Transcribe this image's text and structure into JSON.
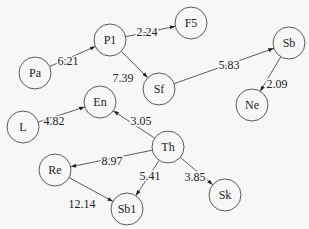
{
  "diagram": {
    "type": "directed-weighted-graph",
    "style": {
      "background": "#f7f7f7",
      "stroke": "#333333",
      "node_fill": "#f7f7f7",
      "node_radius": 16
    },
    "nodes": [
      {
        "id": "Pa",
        "label": "Pa",
        "x": 35,
        "y": 73
      },
      {
        "id": "P1",
        "label": "P1",
        "x": 110,
        "y": 40
      },
      {
        "id": "F5",
        "label": "F5",
        "x": 191,
        "y": 23
      },
      {
        "id": "Sf",
        "label": "Sf",
        "x": 159,
        "y": 89
      },
      {
        "id": "Sb",
        "label": "Sb",
        "x": 289,
        "y": 43
      },
      {
        "id": "Ne",
        "label": "Ne",
        "x": 252,
        "y": 105
      },
      {
        "id": "En",
        "label": "En",
        "x": 100,
        "y": 102
      },
      {
        "id": "L",
        "label": "L",
        "x": 23,
        "y": 127
      },
      {
        "id": "Th",
        "label": "Th",
        "x": 168,
        "y": 147
      },
      {
        "id": "Re",
        "label": "Re",
        "x": 55,
        "y": 170
      },
      {
        "id": "Sb1",
        "label": "Sb1",
        "x": 127,
        "y": 209
      },
      {
        "id": "Sk",
        "label": "Sk",
        "x": 225,
        "y": 195
      }
    ],
    "edges": [
      {
        "from": "Pa",
        "to": "P1",
        "label": "6.21",
        "lx": 68,
        "ly": 61
      },
      {
        "from": "P1",
        "to": "F5",
        "label": "2.24",
        "lx": 147,
        "ly": 32
      },
      {
        "from": "P1",
        "to": "Sf",
        "label": "7.39",
        "lx": 123,
        "ly": 78
      },
      {
        "from": "Sf",
        "to": "Sb",
        "label": "5.83",
        "lx": 229,
        "ly": 65
      },
      {
        "from": "Sb",
        "to": "Ne",
        "label": "2.09",
        "lx": 277,
        "ly": 84
      },
      {
        "from": "L",
        "to": "En",
        "label": "4.82",
        "lx": 54,
        "ly": 121
      },
      {
        "from": "Th",
        "to": "En",
        "label": "3.05",
        "lx": 141,
        "ly": 121
      },
      {
        "from": "Th",
        "to": "Re",
        "label": "8.97",
        "lx": 112,
        "ly": 161
      },
      {
        "from": "Th",
        "to": "Sb1",
        "label": "5.41",
        "lx": 150,
        "ly": 176
      },
      {
        "from": "Th",
        "to": "Sk",
        "label": "3.85",
        "lx": 195,
        "ly": 177
      },
      {
        "from": "Re",
        "to": "Sb1",
        "label": "12.14",
        "lx": 82,
        "ly": 204
      }
    ]
  }
}
